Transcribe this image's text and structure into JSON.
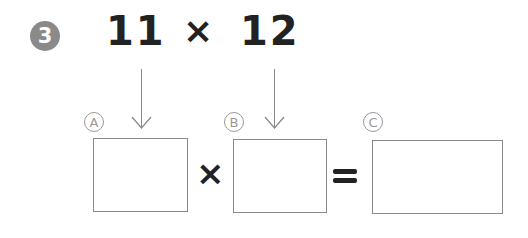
{
  "problem": {
    "number": "3",
    "left_operand": "11",
    "operator": "×",
    "right_operand": "12"
  },
  "equation": {
    "box_a_label": "A",
    "box_b_label": "B",
    "box_c_label": "C",
    "times_symbol": "×",
    "equals_symbol": "=",
    "box_a_value": "",
    "box_b_value": "",
    "box_c_value": ""
  },
  "colors": {
    "badge": "#8a8a8a",
    "text": "#222222",
    "lines": "#8a8a8a"
  }
}
